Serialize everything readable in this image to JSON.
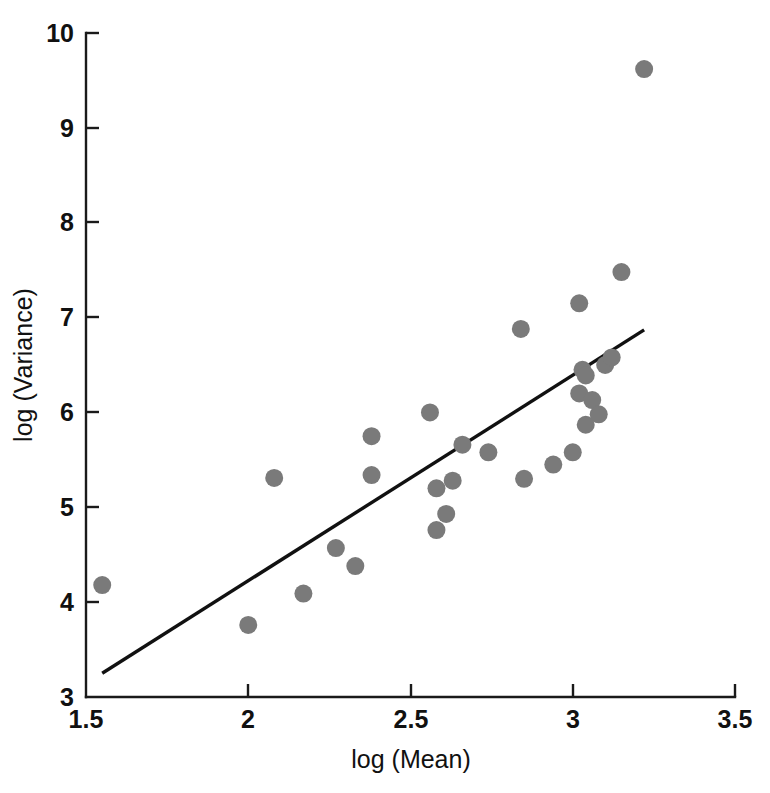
{
  "chart_data": {
    "type": "scatter",
    "title": "",
    "xlabel": "log (Mean)",
    "ylabel": "log (Variance)",
    "xlim": [
      1.5,
      3.5
    ],
    "ylim": [
      3,
      10
    ],
    "xticks": [
      1.5,
      2,
      2.5,
      3,
      3.5
    ],
    "xtick_labels": [
      "1.5",
      "2",
      "2.5",
      "3",
      "3.5"
    ],
    "yticks": [
      3,
      4,
      5,
      6,
      7,
      8,
      9,
      10
    ],
    "ytick_labels": [
      "3",
      "4",
      "5",
      "6",
      "7",
      "8",
      "9",
      "10"
    ],
    "grid": false,
    "legend": null,
    "marker": {
      "shape": "circle",
      "color": "#7a7a7a",
      "size_px": 18
    },
    "points": [
      {
        "x": 1.55,
        "y": 4.18
      },
      {
        "x": 2.0,
        "y": 3.76
      },
      {
        "x": 2.08,
        "y": 5.31
      },
      {
        "x": 2.17,
        "y": 4.09
      },
      {
        "x": 2.27,
        "y": 4.57
      },
      {
        "x": 2.33,
        "y": 4.38
      },
      {
        "x": 2.38,
        "y": 5.75
      },
      {
        "x": 2.38,
        "y": 5.34
      },
      {
        "x": 2.56,
        "y": 6.0
      },
      {
        "x": 2.58,
        "y": 5.2
      },
      {
        "x": 2.58,
        "y": 4.76
      },
      {
        "x": 2.61,
        "y": 4.93
      },
      {
        "x": 2.63,
        "y": 5.28
      },
      {
        "x": 2.66,
        "y": 5.66
      },
      {
        "x": 2.74,
        "y": 5.58
      },
      {
        "x": 2.84,
        "y": 6.88
      },
      {
        "x": 2.85,
        "y": 5.3
      },
      {
        "x": 2.94,
        "y": 5.45
      },
      {
        "x": 3.0,
        "y": 5.58
      },
      {
        "x": 3.02,
        "y": 6.2
      },
      {
        "x": 3.02,
        "y": 7.15
      },
      {
        "x": 3.03,
        "y": 6.45
      },
      {
        "x": 3.04,
        "y": 6.39
      },
      {
        "x": 3.04,
        "y": 5.87
      },
      {
        "x": 3.06,
        "y": 6.13
      },
      {
        "x": 3.08,
        "y": 5.98
      },
      {
        "x": 3.1,
        "y": 6.5
      },
      {
        "x": 3.12,
        "y": 6.58
      },
      {
        "x": 3.15,
        "y": 7.48
      },
      {
        "x": 3.22,
        "y": 9.62
      }
    ],
    "fit_line": {
      "style": "solid",
      "color": "#111111",
      "x_start": 1.55,
      "y_start": 3.25,
      "x_end": 3.22,
      "y_end": 6.87
    }
  }
}
